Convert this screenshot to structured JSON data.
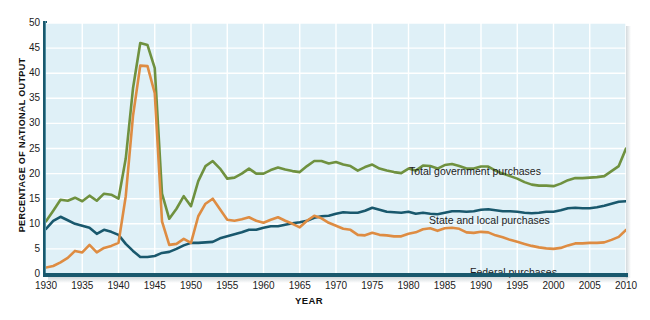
{
  "chart_data": {
    "type": "line",
    "title": "",
    "xlabel": "YEAR",
    "ylabel": "PERCENTAGE OF NATIONAL OUTPUT",
    "xlim": [
      1930,
      2010
    ],
    "ylim": [
      0,
      50
    ],
    "grid": true,
    "legend_position": "inline-annotations",
    "y_ticks": [
      50,
      45,
      40,
      35,
      30,
      25,
      20,
      15,
      10,
      5,
      0
    ],
    "x_ticks": [
      1930,
      1935,
      1940,
      1945,
      1950,
      1955,
      1960,
      1965,
      1970,
      1975,
      1980,
      1985,
      1990,
      1995,
      2000,
      2005,
      2010
    ],
    "colors": {
      "total": "#6f913f",
      "state_local": "#19586d",
      "federal": "#de8c42",
      "plot_background": "#dff0f7",
      "gridline": "#ffffff",
      "axis": "#19586d",
      "page_background": "#ffffff",
      "text": "#1b1b1b"
    },
    "x": [
      1930,
      1931,
      1932,
      1933,
      1934,
      1935,
      1936,
      1937,
      1938,
      1939,
      1940,
      1941,
      1942,
      1943,
      1944,
      1945,
      1946,
      1947,
      1948,
      1949,
      1950,
      1951,
      1952,
      1953,
      1954,
      1955,
      1956,
      1957,
      1958,
      1959,
      1960,
      1961,
      1962,
      1963,
      1964,
      1965,
      1966,
      1967,
      1968,
      1969,
      1970,
      1971,
      1972,
      1973,
      1974,
      1975,
      1976,
      1977,
      1978,
      1979,
      1980,
      1981,
      1982,
      1983,
      1984,
      1985,
      1986,
      1987,
      1988,
      1989,
      1990,
      1991,
      1992,
      1993,
      1994,
      1995,
      1996,
      1997,
      1998,
      1999,
      2000,
      2001,
      2002,
      2003,
      2004,
      2005,
      2006,
      2007,
      2008,
      2009,
      2010
    ],
    "series": [
      {
        "name": "Total government purchases",
        "color": "#6f913f",
        "label_text": "Total government purchases",
        "values": [
          10.5,
          12.6,
          14.8,
          14.6,
          15.2,
          14.5,
          15.6,
          14.6,
          16.0,
          15.8,
          15.0,
          23.0,
          37.0,
          46.0,
          45.6,
          41.0,
          16.0,
          11.0,
          13.0,
          15.5,
          13.5,
          18.5,
          21.5,
          22.5,
          21.0,
          19.0,
          19.2,
          20.0,
          21.0,
          20.0,
          20.0,
          20.7,
          21.2,
          20.8,
          20.5,
          20.3,
          21.5,
          22.5,
          22.5,
          22.0,
          22.3,
          21.8,
          21.5,
          20.6,
          21.3,
          21.8,
          21.0,
          20.6,
          20.3,
          20.1,
          21.0,
          20.6,
          21.6,
          21.5,
          21.0,
          21.7,
          21.9,
          21.5,
          21.0,
          21.0,
          21.4,
          21.4,
          20.6,
          20.0,
          19.5,
          19.0,
          18.3,
          17.8,
          17.6,
          17.6,
          17.5,
          18.0,
          18.7,
          19.1,
          19.1,
          19.2,
          19.3,
          19.5,
          20.5,
          21.5,
          25.0
        ]
      },
      {
        "name": "State and local purchases",
        "color": "#19586d",
        "label_text": "State and local purchases",
        "values": [
          9.0,
          10.6,
          11.4,
          10.7,
          10.0,
          9.6,
          9.2,
          8.0,
          8.8,
          8.4,
          7.8,
          6.0,
          4.6,
          3.4,
          3.4,
          3.6,
          4.2,
          4.4,
          5.0,
          5.7,
          6.2,
          6.2,
          6.3,
          6.4,
          7.1,
          7.5,
          7.9,
          8.3,
          8.8,
          8.8,
          9.2,
          9.5,
          9.5,
          9.8,
          10.1,
          10.3,
          10.6,
          11.2,
          11.5,
          11.6,
          12.0,
          12.3,
          12.2,
          12.2,
          12.6,
          13.2,
          12.8,
          12.4,
          12.3,
          12.2,
          12.4,
          12.0,
          12.2,
          12.0,
          11.9,
          12.2,
          12.5,
          12.5,
          12.4,
          12.5,
          12.8,
          12.9,
          12.7,
          12.5,
          12.5,
          12.4,
          12.2,
          12.1,
          12.2,
          12.4,
          12.4,
          12.7,
          13.1,
          13.2,
          13.1,
          13.1,
          13.3,
          13.6,
          14.0,
          14.4,
          14.5
        ]
      },
      {
        "name": "Federal purchases",
        "color": "#de8c42",
        "label_text": "Federal purchases",
        "values": [
          1.3,
          1.6,
          2.3,
          3.2,
          4.6,
          4.3,
          5.8,
          4.3,
          5.2,
          5.6,
          6.2,
          15.5,
          31.5,
          41.5,
          41.4,
          36.0,
          10.5,
          5.8,
          6.0,
          7.0,
          6.2,
          11.5,
          14.0,
          15.0,
          12.9,
          10.8,
          10.6,
          10.9,
          11.3,
          10.6,
          10.2,
          10.8,
          11.3,
          10.6,
          10.0,
          9.3,
          10.6,
          11.6,
          11.1,
          10.2,
          9.6,
          9.0,
          8.8,
          7.8,
          7.7,
          8.2,
          7.8,
          7.7,
          7.5,
          7.5,
          8.0,
          8.3,
          8.9,
          9.1,
          8.6,
          9.1,
          9.2,
          9.0,
          8.3,
          8.2,
          8.4,
          8.3,
          7.7,
          7.3,
          6.8,
          6.4,
          6.0,
          5.6,
          5.3,
          5.1,
          5.0,
          5.2,
          5.7,
          6.1,
          6.1,
          6.2,
          6.2,
          6.3,
          6.8,
          7.4,
          8.8
        ]
      }
    ]
  },
  "axes": {
    "y_title": "PERCENTAGE OF NATIONAL OUTPUT",
    "x_title": "YEAR"
  }
}
